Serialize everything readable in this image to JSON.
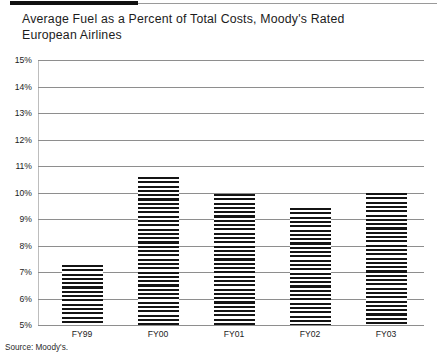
{
  "header": {
    "title": "Average Fuel as a Percent of Total Costs, Moody's Rated\nEuropean Airlines"
  },
  "footer": {
    "source": "Source: Moody's."
  },
  "chart_data": {
    "type": "bar",
    "title": "Average Fuel as a Percent of Total Costs, Moody's Rated European Airlines",
    "xlabel": "",
    "ylabel": "",
    "categories": [
      "FY99",
      "FY00",
      "FY01",
      "FY02",
      "FY03"
    ],
    "values": [
      7.25,
      10.6,
      9.95,
      9.4,
      10.0
    ],
    "value_labels": [
      "7.25%",
      "10.6%",
      "9.95%",
      "9.4%",
      "10.0%"
    ],
    "ylim": [
      5,
      15
    ],
    "ytick_labels": [
      "15%",
      "14%",
      "13%",
      "12%",
      "11%",
      "10%",
      "9%",
      "8%",
      "7%",
      "6%",
      "5%"
    ],
    "ytick_values": [
      15,
      14,
      13,
      12,
      11,
      10,
      9,
      8,
      7,
      6,
      5
    ],
    "grid": true,
    "legend": "none",
    "bar_fill": "horizontal-stripe-hatch",
    "colors": {
      "bar": "#141414",
      "gridline": "#8e8e8e",
      "axis": "#4a4a4a",
      "text": "#1c1c1c",
      "rule_thick": "#111111",
      "rule_thin": "#9a9a9a"
    }
  }
}
